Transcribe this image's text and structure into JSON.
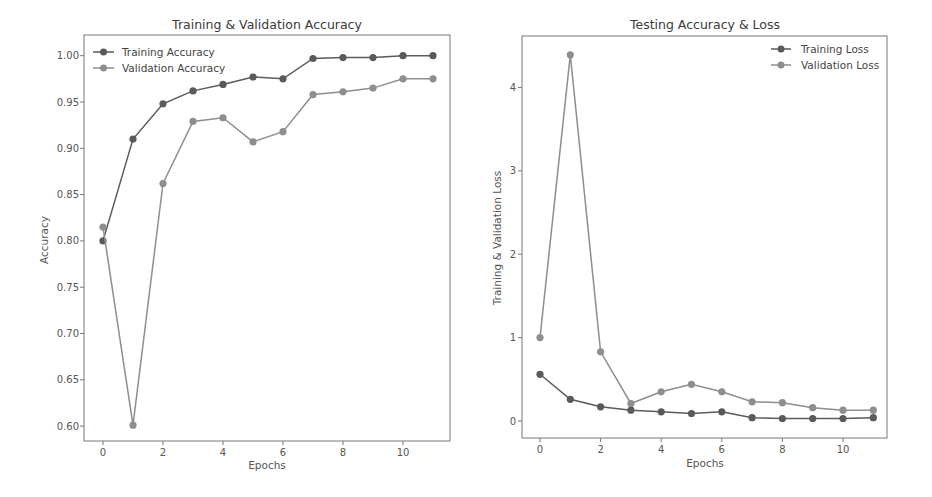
{
  "colors": {
    "background": "#ffffff",
    "training": "#5a5a5a",
    "validation": "#8e8e8e",
    "axes": "#666666",
    "text": "#444444"
  },
  "chart_data": [
    {
      "type": "line",
      "title": "Training & Validation Accuracy",
      "xlabel": "Epochs",
      "ylabel": "Accuracy",
      "x": [
        0,
        1,
        2,
        3,
        4,
        5,
        6,
        7,
        8,
        9,
        10,
        11
      ],
      "xticks": [
        "0",
        "2",
        "4",
        "6",
        "8",
        "10"
      ],
      "yticks": [
        "0.60",
        "0.65",
        "0.70",
        "0.75",
        "0.80",
        "0.85",
        "0.90",
        "0.95",
        "1.00"
      ],
      "ylim": [
        0.58,
        1.02
      ],
      "grid": false,
      "legend_position": "upper left",
      "series": [
        {
          "name": "Training Accuracy",
          "values": [
            0.8,
            0.91,
            0.948,
            0.962,
            0.969,
            0.977,
            0.975,
            0.997,
            0.998,
            0.998,
            1.0,
            1.0
          ]
        },
        {
          "name": "Validation Accuracy",
          "values": [
            0.815,
            0.601,
            0.862,
            0.929,
            0.933,
            0.907,
            0.918,
            0.958,
            0.961,
            0.965,
            0.975,
            0.975
          ]
        }
      ]
    },
    {
      "type": "line",
      "title": "Testing Accuracy & Loss",
      "xlabel": "Epochs",
      "ylabel": "Training & Validation Loss",
      "x": [
        0,
        1,
        2,
        3,
        4,
        5,
        6,
        7,
        8,
        9,
        10,
        11
      ],
      "xticks": [
        "0",
        "2",
        "4",
        "6",
        "8",
        "10"
      ],
      "yticks": [
        "0",
        "1",
        "2",
        "3",
        "4"
      ],
      "ylim": [
        -0.2,
        4.6
      ],
      "grid": false,
      "legend_position": "upper right",
      "series": [
        {
          "name": "Training Loss",
          "values": [
            0.56,
            0.26,
            0.17,
            0.13,
            0.11,
            0.09,
            0.11,
            0.04,
            0.03,
            0.03,
            0.03,
            0.04
          ]
        },
        {
          "name": "Validation Loss",
          "values": [
            1.0,
            4.39,
            0.83,
            0.21,
            0.35,
            0.44,
            0.35,
            0.23,
            0.22,
            0.16,
            0.13,
            0.13
          ]
        }
      ]
    }
  ]
}
